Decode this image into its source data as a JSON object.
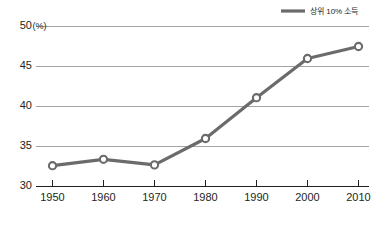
{
  "chart_data": {
    "type": "line",
    "title": "",
    "subtitle": "",
    "xlabel": "",
    "ylabel": "",
    "yunit": "(%)",
    "categories": [
      "1950",
      "1960",
      "1970",
      "1980",
      "1990",
      "2000",
      "2010"
    ],
    "x": [
      1950,
      1960,
      1970,
      1980,
      1990,
      2000,
      2010
    ],
    "series": [
      {
        "name": "상위 10% 소득",
        "values": [
          32.6,
          33.4,
          32.7,
          36.0,
          41.1,
          46.0,
          47.5
        ],
        "color": "#6b6b6b",
        "marker": "circle-open"
      }
    ],
    "ylim": [
      30,
      50
    ],
    "yticks": [
      30,
      35,
      40,
      45,
      50
    ],
    "ytick_labels": [
      "30",
      "35",
      "40",
      "45",
      "50"
    ],
    "xtick_labels": [
      "1950",
      "1960",
      "1970",
      "1980",
      "1990",
      "2000",
      "2010"
    ],
    "grid": true,
    "grid_axis": "y",
    "legend_position": "top-right",
    "legend_entries": [
      "상위 10% 소득"
    ],
    "background": "#ffffff",
    "grid_color": "#8c8c8c",
    "axis_color": "#231f20"
  }
}
